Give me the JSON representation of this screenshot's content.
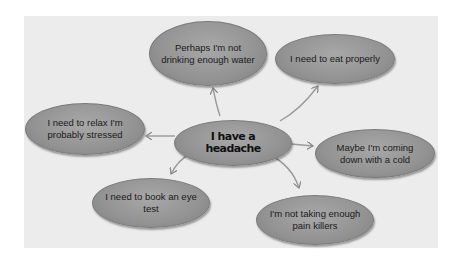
{
  "diagram": {
    "type": "mind-map",
    "background_color": "#ececec",
    "node_color": "#999999",
    "center": {
      "label": "I have a headache"
    },
    "branches": [
      {
        "label": "Perhaps I'm not drinking enough water",
        "direction": "up"
      },
      {
        "label": "I need to eat properly",
        "direction": "up-right"
      },
      {
        "label": "I need to relax I'm probably stressed",
        "direction": "left"
      },
      {
        "label": "Maybe I'm coming down with a cold",
        "direction": "right"
      },
      {
        "label": "I need to book an eye test",
        "direction": "down-left"
      },
      {
        "label": "I'm not taking enough pain killers",
        "direction": "down-right"
      }
    ]
  }
}
